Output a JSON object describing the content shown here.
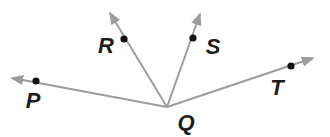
{
  "figure": {
    "width": 330,
    "height": 137,
    "background_color": "#ffffff",
    "ray_color": "#9c9c9c",
    "dot_color": "#121212",
    "label_color": "#1c1c1c",
    "ray_stroke_width": 2,
    "dot_radius": 3.6,
    "label_font_size": 22,
    "vertex": {
      "label": "Q",
      "x": 167,
      "y": 107,
      "label_x": 186,
      "label_y": 130
    },
    "rays": [
      {
        "name": "ray-QP",
        "tip_x": 12,
        "tip_y": 78,
        "point": {
          "label": "P",
          "x": 36,
          "y": 81,
          "label_x": 33,
          "label_y": 108
        }
      },
      {
        "name": "ray-QR",
        "tip_x": 110,
        "tip_y": 13,
        "point": {
          "label": "R",
          "x": 124,
          "y": 39,
          "label_x": 106,
          "label_y": 53
        }
      },
      {
        "name": "ray-QS",
        "tip_x": 200,
        "tip_y": 14,
        "point": {
          "label": "S",
          "x": 193,
          "y": 38,
          "label_x": 213,
          "label_y": 54
        }
      },
      {
        "name": "ray-QT",
        "tip_x": 313,
        "tip_y": 58,
        "point": {
          "label": "T",
          "x": 291,
          "y": 66,
          "label_x": 277,
          "label_y": 95
        }
      }
    ]
  }
}
